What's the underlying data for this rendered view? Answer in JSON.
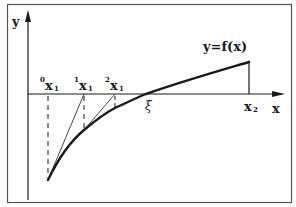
{
  "figure": {
    "type": "newton-method-diagram",
    "axes": {
      "y_label": "y",
      "x_label": "x"
    },
    "function_label": "y=f(x)",
    "root_label": "ξ",
    "points": [
      {
        "sup": "0",
        "base": "x",
        "sub": "1"
      },
      {
        "sup": "1",
        "base": "x",
        "sub": "1"
      },
      {
        "sup": "2",
        "base": "x",
        "sub": "1"
      }
    ],
    "right_bound": {
      "base": "x",
      "sub": "2"
    },
    "colors": {
      "stroke": "#1a1a1a",
      "border": "#555555",
      "background": "#ffffff"
    }
  }
}
